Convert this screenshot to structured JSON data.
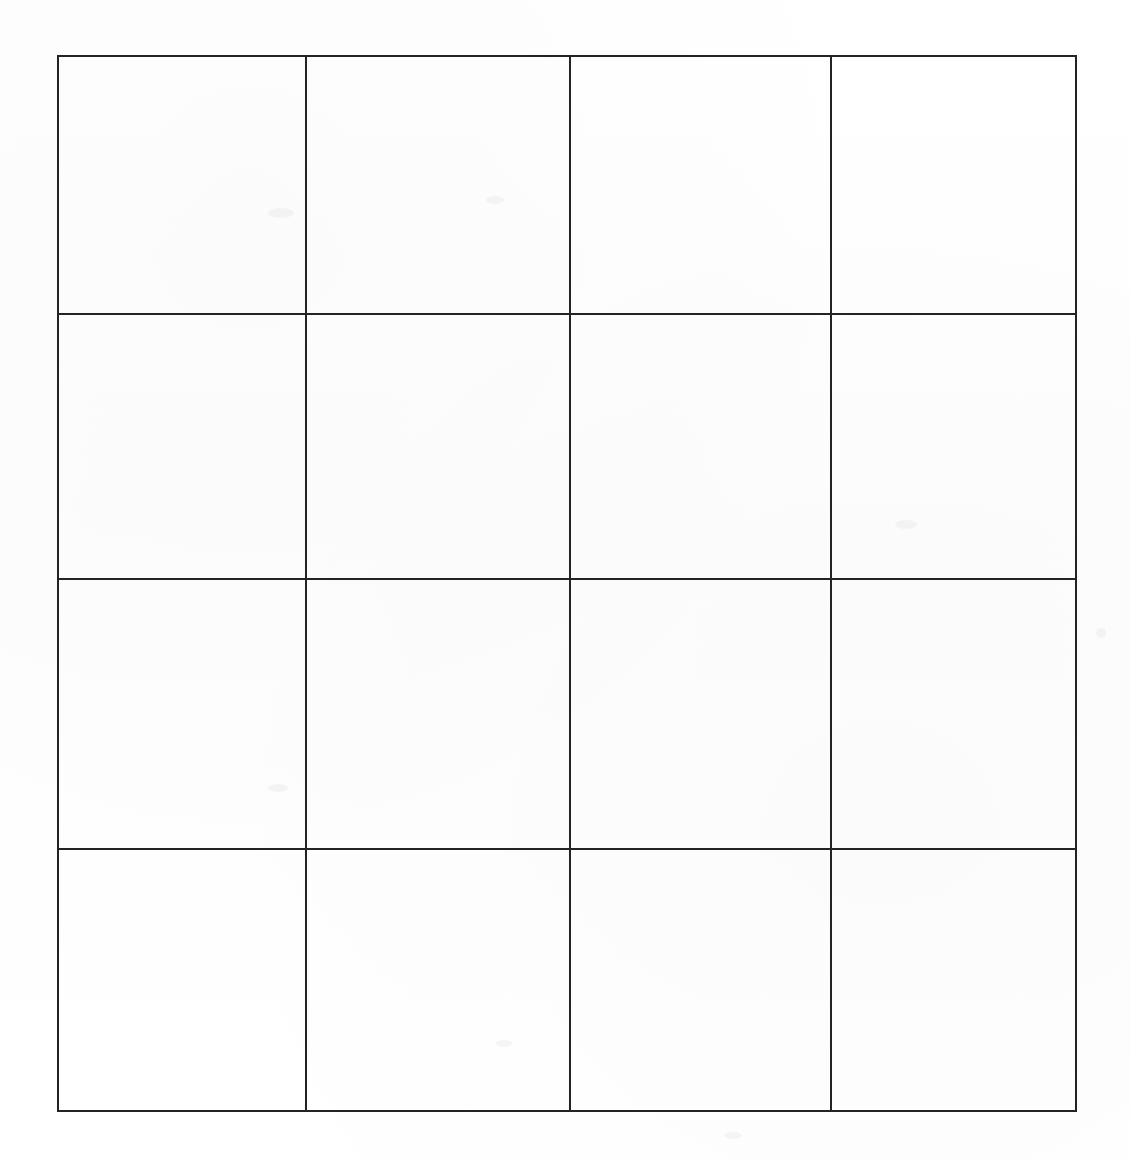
{
  "document": {
    "kind": "scanned-blank-grid",
    "background_color": "#ffffff",
    "line_color": "#232323",
    "line_width_px": 2,
    "page_width_px": 1130,
    "page_height_px": 1161
  },
  "grid": {
    "rows": 4,
    "columns": 4,
    "total_cells": 16,
    "bounds": {
      "left_px": 57,
      "top_px": 55,
      "right_px": 1075,
      "bottom_px": 1110,
      "width_px": 1018,
      "height_px": 1055
    },
    "vertical_line_x_px": [
      57,
      305,
      569,
      830,
      1075
    ],
    "horizontal_line_y_px": [
      55,
      313,
      578,
      848,
      1110
    ],
    "column_widths_px": [
      248,
      264,
      261,
      245
    ],
    "row_heights_px": [
      258,
      265,
      270,
      262
    ],
    "cells": [
      [
        {
          "row": 1,
          "col": 1,
          "text": ""
        },
        {
          "row": 1,
          "col": 2,
          "text": ""
        },
        {
          "row": 1,
          "col": 3,
          "text": ""
        },
        {
          "row": 1,
          "col": 4,
          "text": ""
        }
      ],
      [
        {
          "row": 2,
          "col": 1,
          "text": ""
        },
        {
          "row": 2,
          "col": 2,
          "text": ""
        },
        {
          "row": 2,
          "col": 3,
          "text": ""
        },
        {
          "row": 2,
          "col": 4,
          "text": ""
        }
      ],
      [
        {
          "row": 3,
          "col": 1,
          "text": ""
        },
        {
          "row": 3,
          "col": 2,
          "text": ""
        },
        {
          "row": 3,
          "col": 3,
          "text": ""
        },
        {
          "row": 3,
          "col": 4,
          "text": ""
        }
      ],
      [
        {
          "row": 4,
          "col": 1,
          "text": ""
        },
        {
          "row": 4,
          "col": 2,
          "text": ""
        },
        {
          "row": 4,
          "col": 3,
          "text": ""
        },
        {
          "row": 4,
          "col": 4,
          "text": ""
        }
      ]
    ]
  }
}
